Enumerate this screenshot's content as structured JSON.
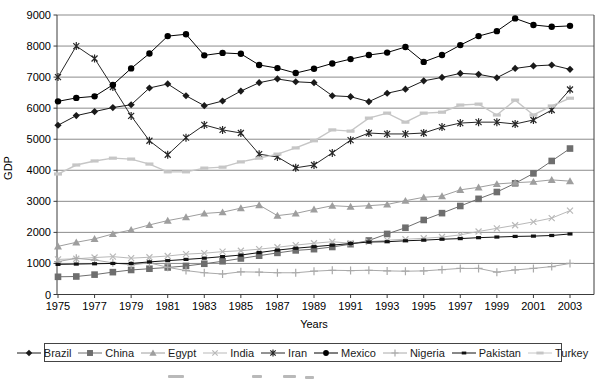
{
  "chart_data": {
    "type": "line",
    "title": "",
    "xlabel": "Years",
    "ylabel": "GDP",
    "x": [
      1975,
      1976,
      1977,
      1978,
      1979,
      1980,
      1981,
      1982,
      1983,
      1984,
      1985,
      1986,
      1987,
      1988,
      1989,
      1990,
      1991,
      1992,
      1993,
      1994,
      1995,
      1996,
      1997,
      1998,
      1999,
      2000,
      2001,
      2002,
      2003
    ],
    "x_tick_labels": [
      "1975",
      "1977",
      "1979",
      "1981",
      "1983",
      "1985",
      "1987",
      "1989",
      "1991",
      "1993",
      "1995",
      "1997",
      "1999",
      "2001",
      "2003"
    ],
    "y_ticks": [
      0,
      1000,
      2000,
      3000,
      4000,
      5000,
      6000,
      7000,
      8000,
      9000
    ],
    "ylim": [
      0,
      9000
    ],
    "grid": "horizontal",
    "legend_position": "bottom",
    "series": [
      {
        "name": "Brazil",
        "marker": "diamond",
        "color": "#1a1a1a",
        "values": [
          5450,
          5760,
          5890,
          6020,
          6110,
          6650,
          6780,
          6400,
          6080,
          6230,
          6550,
          6820,
          6940,
          6850,
          6820,
          6400,
          6370,
          6210,
          6480,
          6610,
          6880,
          6990,
          7120,
          7090,
          6980,
          7280,
          7360,
          7390,
          7250
        ]
      },
      {
        "name": "China",
        "marker": "square",
        "color": "#6e6e6e",
        "values": [
          570,
          580,
          640,
          720,
          790,
          830,
          870,
          920,
          990,
          1070,
          1160,
          1250,
          1340,
          1420,
          1460,
          1530,
          1620,
          1740,
          1950,
          2150,
          2400,
          2620,
          2850,
          3080,
          3300,
          3580,
          3900,
          4300,
          4700
        ]
      },
      {
        "name": "Egypt",
        "marker": "triangle",
        "color": "#9e9e9e",
        "values": [
          1550,
          1680,
          1790,
          1950,
          2080,
          2240,
          2380,
          2490,
          2610,
          2650,
          2780,
          2880,
          2540,
          2610,
          2740,
          2860,
          2830,
          2860,
          2900,
          3020,
          3130,
          3170,
          3370,
          3450,
          3560,
          3600,
          3630,
          3690,
          3650
        ]
      },
      {
        "name": "India",
        "marker": "x",
        "color": "#b9b9b9",
        "values": [
          1130,
          1150,
          1190,
          1220,
          1170,
          1200,
          1240,
          1300,
          1330,
          1380,
          1410,
          1460,
          1520,
          1590,
          1650,
          1700,
          1650,
          1700,
          1750,
          1780,
          1810,
          1850,
          1920,
          2030,
          2130,
          2230,
          2340,
          2460,
          2700
        ]
      },
      {
        "name": "Iran",
        "marker": "star",
        "color": "#262626",
        "values": [
          7000,
          8000,
          7600,
          6680,
          5750,
          4950,
          4500,
          5050,
          5460,
          5300,
          5200,
          4520,
          4430,
          4080,
          4170,
          4560,
          4970,
          5200,
          5170,
          5170,
          5200,
          5390,
          5520,
          5550,
          5550,
          5490,
          5620,
          5940,
          6600
        ]
      },
      {
        "name": "Mexico",
        "marker": "circle",
        "color": "#000000",
        "values": [
          6220,
          6330,
          6380,
          6750,
          7280,
          7760,
          8320,
          8380,
          7700,
          7780,
          7750,
          7390,
          7290,
          7130,
          7270,
          7440,
          7580,
          7710,
          7790,
          7970,
          7490,
          7710,
          8030,
          8320,
          8480,
          8890,
          8680,
          8620,
          8650
        ]
      },
      {
        "name": "Nigeria",
        "marker": "plus",
        "color": "#aaaaaa",
        "values": [
          1060,
          1165,
          1110,
          1020,
          950,
          1020,
          875,
          770,
          700,
          660,
          730,
          720,
          700,
          700,
          750,
          780,
          770,
          780,
          760,
          750,
          760,
          800,
          840,
          840,
          720,
          790,
          840,
          900,
          1000
        ]
      },
      {
        "name": "Pakistan",
        "marker": "dash-small",
        "color": "#111111",
        "values": [
          970,
          980,
          990,
          1000,
          1000,
          1050,
          1090,
          1130,
          1170,
          1220,
          1270,
          1350,
          1430,
          1490,
          1540,
          1590,
          1640,
          1690,
          1700,
          1730,
          1750,
          1780,
          1800,
          1830,
          1850,
          1870,
          1880,
          1900,
          1950
        ]
      },
      {
        "name": "Turkey",
        "marker": "dash",
        "color": "#c6c6c6",
        "values": [
          3880,
          4170,
          4300,
          4390,
          4360,
          4200,
          3950,
          3950,
          4070,
          4100,
          4270,
          4390,
          4520,
          4720,
          4950,
          5300,
          5260,
          5680,
          5840,
          5550,
          5840,
          5870,
          6100,
          6130,
          5780,
          6260,
          5780,
          6070,
          6320
        ]
      }
    ]
  }
}
